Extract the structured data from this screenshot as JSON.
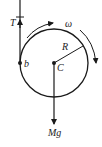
{
  "diagram": {
    "type": "free-body diagram of a rotating disk (yo-yo) hanging from a string",
    "labels": {
      "tension": "T",
      "angular_velocity": "ω",
      "radius": "R",
      "contact_point": "b",
      "center": "C",
      "weight": "Mg"
    },
    "colors": {
      "stroke": "#1a1a1a",
      "background": "#ffffff"
    }
  }
}
